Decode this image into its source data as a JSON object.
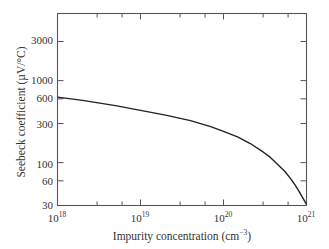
{
  "chart_data": {
    "type": "line",
    "title": "",
    "xlabel": "Impurity concentration (cm⁻³)",
    "ylabel": "Seebeck coefficient (µV/°C)",
    "xscale": "log",
    "yscale": "log",
    "xlim": [
      1e+18,
      1e+21
    ],
    "ylim": [
      30,
      6500
    ],
    "x_ticks": [
      {
        "value": 1e+18,
        "base": "10",
        "exp": "18"
      },
      {
        "value": 1e+19,
        "base": "10",
        "exp": "19"
      },
      {
        "value": 1e+20,
        "base": "10",
        "exp": "20"
      },
      {
        "value": 1e+21,
        "base": "10",
        "exp": "21"
      }
    ],
    "y_ticks": [
      30,
      60,
      100,
      300,
      600,
      1000,
      3000
    ],
    "x_minor_ticks": [
      3e+18,
      6e+18,
      3e+19,
      6e+19,
      3e+20,
      6e+20
    ],
    "grid": false,
    "legend": null,
    "series": [
      {
        "name": "Seebeck coefficient",
        "color": "#222222",
        "x": [
          1e+18,
          2e+18,
          5e+18,
          1e+19,
          2e+19,
          4e+19,
          7e+19,
          1e+20,
          1.5e+20,
          2.1e+20,
          3e+20,
          3.7e+20,
          4.5e+20,
          5.5e+20,
          6.5e+20,
          7.3e+20,
          8.2e+20,
          8.9e+20,
          9.5e+20,
          1e+21
        ],
        "values": [
          630,
          575,
          495,
          433,
          380,
          325,
          275,
          240,
          205,
          171,
          135,
          115,
          95,
          78,
          63,
          53,
          44,
          38,
          34,
          31
        ]
      }
    ]
  },
  "labels": {
    "x_axis": "Impurity concentration (cm",
    "x_axis_sup": "−3",
    "x_axis_close": ")",
    "y_axis": "Seebeck coefficient (µV/°C)",
    "y_tick_labels": [
      "3000",
      "1000",
      "600",
      "300",
      "100",
      "60",
      "30"
    ],
    "x_tick_bases": [
      "10",
      "10",
      "10",
      "10"
    ],
    "x_tick_exps": [
      "18",
      "19",
      "20",
      "21"
    ]
  }
}
